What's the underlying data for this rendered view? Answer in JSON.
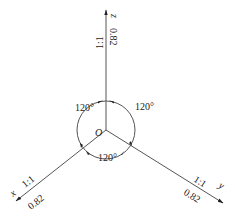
{
  "diagram": {
    "origin": {
      "label": "O"
    },
    "axes": [
      {
        "id": "z",
        "label": "z",
        "ratio": "1:1",
        "coefficient": "0.82"
      },
      {
        "id": "x",
        "label": "x",
        "ratio": "1:1",
        "coefficient": "0.82"
      },
      {
        "id": "y",
        "label": "y",
        "ratio": "1:1",
        "coefficient": "0.82"
      }
    ],
    "angles": [
      {
        "position": "upper-left",
        "value": "120°"
      },
      {
        "position": "upper-right",
        "value": "120°"
      },
      {
        "position": "bottom",
        "value": "120°"
      }
    ],
    "colors": {
      "line": "#555555",
      "text": "#222222"
    }
  }
}
